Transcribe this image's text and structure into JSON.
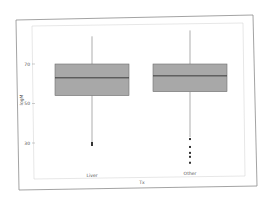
{
  "chart_data": {
    "type": "box",
    "title": "",
    "xlabel": "Tx",
    "ylabel": "logM",
    "categories": [
      "Liver",
      "Other"
    ],
    "yticks": [
      30,
      50,
      70
    ],
    "ylim": [
      18,
      92
    ],
    "grid": false,
    "legend": null,
    "series": [
      {
        "name": "Liver",
        "whisker_low": 30,
        "q1": 54,
        "median": 63,
        "q3": 70,
        "whisker_high": 84,
        "outliers": [
          29,
          30
        ]
      },
      {
        "name": "Other",
        "whisker_low": 33,
        "q1": 56,
        "median": 64,
        "q3": 70,
        "whisker_high": 87,
        "outliers": [
          32,
          28,
          25,
          23,
          20
        ]
      }
    ],
    "colors": {
      "box_fill": "#a8a8a8",
      "box_edge": "#6e6e6e",
      "median": "#3a3a3a",
      "whisker": "#8a8a8a",
      "outlier": "#333333",
      "frame": "#8c8c8c"
    }
  },
  "axis": {
    "x_label": "Tx",
    "y_label": "logM",
    "x_tick_labels": [
      "Liver",
      "Other"
    ],
    "y_tick_labels": [
      "30",
      "50",
      "70"
    ]
  }
}
